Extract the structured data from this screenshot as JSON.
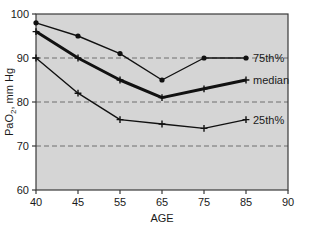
{
  "chart_data": {
    "type": "line",
    "title": "",
    "xlabel": "AGE",
    "ylabel": "PaO2, mm Hg",
    "ylabel_main": "PaO",
    "ylabel_sub": "2",
    "ylabel_rest": ", mm Hg",
    "categories": [
      "40",
      "45",
      "55",
      "65",
      "75",
      "85"
    ],
    "x_tick_labels": [
      "40",
      "45",
      "55",
      "65",
      "75",
      "85",
      "90"
    ],
    "y_tick_labels": [
      "60",
      "70",
      "80",
      "90",
      "100"
    ],
    "ylim": [
      60,
      100
    ],
    "grid": true,
    "gridlines": [
      70,
      80,
      90
    ],
    "grid_style": "dashed",
    "legend_position": "right-inline",
    "series": [
      {
        "name": "75th%",
        "label": "75th%",
        "marker": "circle",
        "line_width": 1.4,
        "color": "#111111",
        "values": [
          98,
          95,
          91,
          85,
          90,
          90
        ]
      },
      {
        "name": "median",
        "label": "median",
        "marker": "plus",
        "line_width": 3.0,
        "color": "#111111",
        "values": [
          96,
          90,
          85,
          81,
          83,
          85
        ]
      },
      {
        "name": "25th%",
        "label": "25th%",
        "marker": "plus",
        "line_width": 1.4,
        "color": "#111111",
        "values": [
          90,
          82,
          76,
          75,
          74,
          76
        ]
      }
    ]
  },
  "colors": {
    "plot_background": "#d5d5d5",
    "page_background": "#ffffff",
    "axis": "#3a3a3a",
    "grid": "#6e6e6e",
    "text": "#1a1a1a",
    "series": "#111111"
  }
}
